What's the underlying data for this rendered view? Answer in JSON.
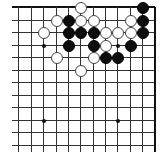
{
  "board": {
    "description": "Go board diagram, top-right corner region",
    "columns_x": [
      18,
      31,
      43,
      56,
      68,
      80,
      93,
      105,
      117,
      130,
      142,
      154
    ],
    "rows_y": [
      7,
      20,
      32,
      45,
      57,
      70,
      82,
      95,
      107,
      120,
      132,
      145
    ],
    "edges": {
      "top": true,
      "right": true,
      "left": false,
      "bottom": false
    },
    "colors": {
      "line": "#333333",
      "black": "#0d0d0d",
      "white": "#ffffff",
      "background": "#ffffff"
    },
    "star_points": [
      {
        "col": 2,
        "row": 3
      },
      {
        "col": 8,
        "row": 3
      },
      {
        "col": 2,
        "row": 9
      },
      {
        "col": 8,
        "row": 9
      }
    ],
    "stones": [
      {
        "color": "white",
        "col": 5,
        "row": 0
      },
      {
        "color": "black",
        "col": 10,
        "row": 0
      },
      {
        "color": "white",
        "col": 3,
        "row": 1
      },
      {
        "color": "black",
        "col": 4,
        "row": 1
      },
      {
        "color": "white",
        "col": 5,
        "row": 1
      },
      {
        "color": "white",
        "col": 6,
        "row": 1
      },
      {
        "color": "white",
        "col": 9,
        "row": 1
      },
      {
        "color": "black",
        "col": 10,
        "row": 1
      },
      {
        "color": "white",
        "col": 2,
        "row": 2
      },
      {
        "color": "black",
        "col": 4,
        "row": 2
      },
      {
        "color": "black",
        "col": 5,
        "row": 2
      },
      {
        "color": "black",
        "col": 6,
        "row": 2
      },
      {
        "color": "white",
        "col": 7,
        "row": 2
      },
      {
        "color": "white",
        "col": 8,
        "row": 2
      },
      {
        "color": "white",
        "col": 9,
        "row": 2
      },
      {
        "color": "black",
        "col": 10,
        "row": 2
      },
      {
        "color": "black",
        "col": 4,
        "row": 3
      },
      {
        "color": "black",
        "col": 6,
        "row": 3
      },
      {
        "color": "white",
        "col": 7,
        "row": 3
      },
      {
        "color": "black",
        "col": 9,
        "row": 3
      },
      {
        "color": "white",
        "col": 3,
        "row": 4
      },
      {
        "color": "white",
        "col": 6,
        "row": 4
      },
      {
        "color": "black",
        "col": 7,
        "row": 4
      },
      {
        "color": "black",
        "col": 8,
        "row": 4
      },
      {
        "color": "white",
        "col": 5,
        "row": 5
      }
    ]
  }
}
